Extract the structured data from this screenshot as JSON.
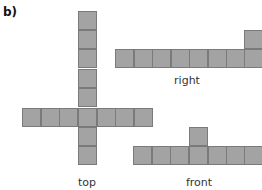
{
  "figure": {
    "part_label": "b)",
    "cell_color": "#a3a3a3",
    "border_color": "#7a7a7a",
    "views": [
      {
        "name": "top",
        "label": "top",
        "label_pos": [
          87,
          176
        ],
        "cells": [
          [
            78,
            11
          ],
          [
            78,
            30
          ],
          [
            78,
            49
          ],
          [
            78,
            69
          ],
          [
            78,
            88
          ],
          [
            22,
            108
          ],
          [
            41,
            108
          ],
          [
            59,
            108
          ],
          [
            78,
            108
          ],
          [
            97,
            108
          ],
          [
            115,
            108
          ],
          [
            134,
            108
          ],
          [
            78,
            127
          ],
          [
            78,
            146
          ]
        ]
      },
      {
        "name": "right",
        "label": "right",
        "label_pos": [
          187,
          74
        ],
        "cells": [
          [
            115,
            49
          ],
          [
            134,
            49
          ],
          [
            152,
            49
          ],
          [
            171,
            49
          ],
          [
            189,
            49
          ],
          [
            208,
            49
          ],
          [
            226,
            49
          ],
          [
            244,
            49
          ],
          [
            244,
            30
          ]
        ]
      },
      {
        "name": "front",
        "label": "front",
        "label_pos": [
          199,
          176
        ],
        "cells": [
          [
            133,
            146
          ],
          [
            152,
            146
          ],
          [
            170,
            146
          ],
          [
            189,
            146
          ],
          [
            208,
            146
          ],
          [
            226,
            146
          ],
          [
            244,
            146
          ],
          [
            189,
            127
          ]
        ]
      }
    ],
    "cell_size": 19
  }
}
